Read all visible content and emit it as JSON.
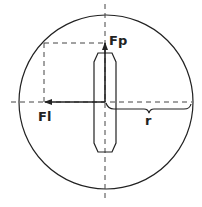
{
  "diagram": {
    "type": "force-diagram",
    "labels": {
      "perpendicular_force": "Fp",
      "lateral_force": "Fl",
      "radius": "r"
    },
    "colors": {
      "stroke": "#222222",
      "background": "#ffffff"
    }
  }
}
